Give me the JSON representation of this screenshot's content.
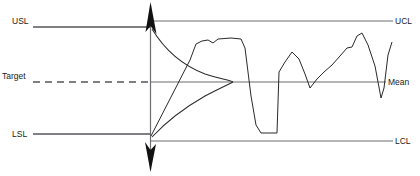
{
  "diagram": {
    "type": "spc-control-chart",
    "background_color": "#ffffff",
    "line_color": "#2a2a2a",
    "reference_line_color": "#55565a"
  },
  "spec_labels": {
    "usl": "USL",
    "target": "Target",
    "lsl": "LSL"
  },
  "control_labels": {
    "ucl": "UCL",
    "mean": "Mean",
    "lcl": "LCL"
  },
  "chart_data": {
    "type": "line",
    "xlabel": "",
    "ylabel": "",
    "grid": false,
    "legend": null,
    "axis_x_position_px": 150,
    "reference_lines": [
      {
        "name": "USL",
        "label": "USL",
        "y_px": 27,
        "x_start_px": 33,
        "x_end_px": 150,
        "style": "solid"
      },
      {
        "name": "Target",
        "label": "Target",
        "y_px": 82,
        "x_start_px": 33,
        "x_end_px": 150,
        "style": "dashed"
      },
      {
        "name": "LSL",
        "label": "LSL",
        "y_px": 134,
        "x_start_px": 33,
        "x_end_px": 150,
        "style": "solid"
      },
      {
        "name": "UCL",
        "label": "UCL",
        "y_px": 21,
        "x_start_px": 150,
        "x_end_px": 393,
        "style": "solid"
      },
      {
        "name": "Mean",
        "label": "Mean",
        "y_px": 82,
        "x_start_px": 150,
        "x_end_px": 386,
        "style": "solid"
      },
      {
        "name": "LCL",
        "label": "LCL",
        "y_px": 141,
        "x_start_px": 150,
        "x_end_px": 393,
        "style": "solid"
      }
    ],
    "distribution_curve": {
      "name": "normal-distribution-sideways",
      "description": "Rotated bell curve along the vertical axis, peak pointing right at the Mean",
      "peak_y_px": 82,
      "peak_x_px": 233,
      "base_x_px": 151,
      "top_y_px": 29,
      "bottom_y_px": 137
    },
    "series": [
      {
        "name": "measurement",
        "points_px": [
          [
            151,
            136
          ],
          [
            190,
            60
          ],
          [
            196,
            44
          ],
          [
            202,
            41
          ],
          [
            208,
            40
          ],
          [
            213,
            43
          ],
          [
            218,
            39
          ],
          [
            231,
            38
          ],
          [
            241,
            39
          ],
          [
            245,
            48
          ],
          [
            251,
            96
          ],
          [
            256,
            125
          ],
          [
            261,
            133
          ],
          [
            277,
            133
          ],
          [
            279,
            72
          ],
          [
            285,
            62
          ],
          [
            292,
            52
          ],
          [
            299,
            59
          ],
          [
            305,
            74
          ],
          [
            310,
            88
          ],
          [
            317,
            79
          ],
          [
            324,
            72
          ],
          [
            332,
            65
          ],
          [
            340,
            56
          ],
          [
            347,
            48
          ],
          [
            352,
            47
          ],
          [
            357,
            36
          ],
          [
            362,
            33
          ],
          [
            368,
            45
          ],
          [
            375,
            66
          ],
          [
            381,
            98
          ],
          [
            384,
            88
          ],
          [
            388,
            55
          ],
          [
            392,
            42
          ]
        ]
      }
    ]
  }
}
